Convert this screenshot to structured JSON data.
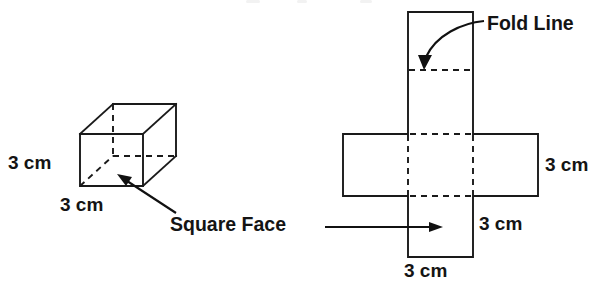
{
  "figure": {
    "title": "",
    "background_color": "#ffffff",
    "stroke_color": "#1a1a1a",
    "text_color": "#141414"
  },
  "cube": {
    "name": "3D cube drawing",
    "edge_length_label": "3 cm",
    "height_dimension": "3 cm",
    "width_dimension": "3 cm",
    "hidden_edges_style": "dashed"
  },
  "net": {
    "name": "cube net drawing",
    "fold_line_label": "Fold Line",
    "right_dimension": "3 cm",
    "middle_dimension": "3 cm",
    "bottom_dimension": "3 cm",
    "fold_lines_style": "dashed"
  },
  "callouts": {
    "square_face": "Square Face",
    "fold_line": "Fold Line"
  },
  "icons": {
    "arrow_to_cube": "arrow-up-left-icon",
    "arrow_to_net": "arrow-right-icon",
    "fold_line_arrow": "curved-arrow-down-icon"
  }
}
